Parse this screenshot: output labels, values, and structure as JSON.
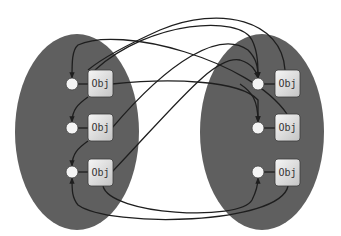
{
  "diagram": {
    "type": "object-reference-graph",
    "colors": {
      "background": "#ffffff",
      "region_fill": "#5f5f5f",
      "object_fill_top": "#f4f4f4",
      "object_fill_bottom": "#c8c8c8",
      "object_stroke": "#3a3a3a",
      "node_fill": "#f4f4f4",
      "edge_stroke": "#1e1e1e"
    },
    "regions": [
      {
        "id": "left",
        "cx": 77,
        "cy": 132,
        "rx": 62,
        "ry": 98
      },
      {
        "id": "right",
        "cx": 262,
        "cy": 132,
        "rx": 62,
        "ry": 98
      }
    ],
    "nodes": [
      {
        "id": "L1",
        "region": "left",
        "label": "Obj",
        "circle": [
          72,
          84
        ],
        "box": [
          88,
          70
        ]
      },
      {
        "id": "L2",
        "region": "left",
        "label": "Obj",
        "circle": [
          72,
          128
        ],
        "box": [
          88,
          114
        ]
      },
      {
        "id": "L3",
        "region": "left",
        "label": "Obj",
        "circle": [
          72,
          172
        ],
        "box": [
          88,
          159
        ]
      },
      {
        "id": "R1",
        "region": "right",
        "label": "Obj",
        "circle": [
          258,
          84
        ],
        "box": [
          275,
          70
        ]
      },
      {
        "id": "R2",
        "region": "right",
        "label": "Obj",
        "circle": [
          258,
          128
        ],
        "box": [
          275,
          114
        ]
      },
      {
        "id": "R3",
        "region": "right",
        "label": "Obj",
        "circle": [
          258,
          172
        ],
        "box": [
          275,
          159
        ]
      }
    ],
    "edges": [
      {
        "from": "R2",
        "to": "L1",
        "note": "arc from right obj 2 over top into left circle 1"
      },
      {
        "from": "L1",
        "to": "R2",
        "note": "left obj 1 right side to right circle 2"
      },
      {
        "from": "L1",
        "to": "L2",
        "note": "left circle 1 down to left circle 2"
      },
      {
        "from": "L2",
        "to": "L3",
        "note": "left circle 2 down to left circle 3"
      },
      {
        "from": "L1",
        "to": "R1",
        "note": "left obj 1 diagonal to right circle 1"
      },
      {
        "from": "L2",
        "to": "R1",
        "note": "left obj 2 to right circle 1"
      },
      {
        "from": "L3",
        "to": "R1",
        "note": "left obj 3 to right circle 1"
      },
      {
        "from": "R1",
        "to": "L2",
        "note": "right obj 1 top arc into left region"
      },
      {
        "from": "R1",
        "to": "R2",
        "note": "right circle 1 down to right circle 2"
      },
      {
        "from": "L3",
        "to": "R3",
        "note": "left obj 3 bottom arc to right circle 3"
      },
      {
        "from": "R3",
        "to": "L3",
        "note": "right obj 3 bottom arc to left circle 3"
      }
    ]
  }
}
